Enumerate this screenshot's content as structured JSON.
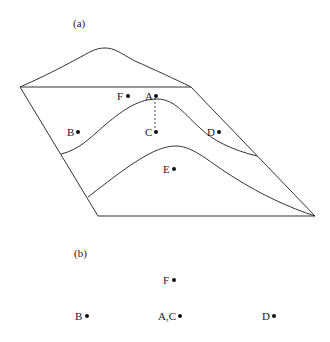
{
  "panel_a": {
    "label": "(a)",
    "points": {
      "A": {
        "label": "A",
        "x": 155,
        "y": 96
      },
      "B": {
        "label": "B",
        "x": 77,
        "y": 132
      },
      "C": {
        "label": "C",
        "x": 155,
        "y": 132
      },
      "D": {
        "label": "D",
        "x": 217,
        "y": 132
      },
      "E": {
        "label": "E",
        "x": 173,
        "y": 169
      },
      "F": {
        "label": "F",
        "x": 128,
        "y": 96
      }
    }
  },
  "panel_b": {
    "label": "(b)",
    "points": {
      "F": {
        "label": "F",
        "x": 173,
        "y": 280
      },
      "B": {
        "label": "B",
        "x": 86,
        "y": 316
      },
      "AC": {
        "label": "A,C",
        "x": 179,
        "y": 316
      },
      "D": {
        "label": "D",
        "x": 273,
        "y": 316
      }
    }
  },
  "colors": {
    "stroke": "#333333",
    "text": "#1a1a1a",
    "background": "#ffffff"
  }
}
